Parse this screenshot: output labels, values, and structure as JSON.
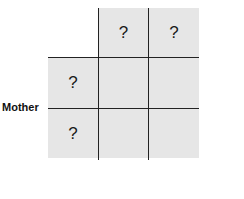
{
  "diagram": {
    "type": "punnett-square",
    "row_label": "Mother",
    "column_headers": [
      "?",
      "?"
    ],
    "row_headers": [
      "?",
      "?"
    ],
    "cells": [
      [
        "",
        ""
      ],
      [
        "",
        ""
      ]
    ],
    "colors": {
      "cell_fill": "#e6e6e6",
      "grid_line": "#222222"
    }
  }
}
